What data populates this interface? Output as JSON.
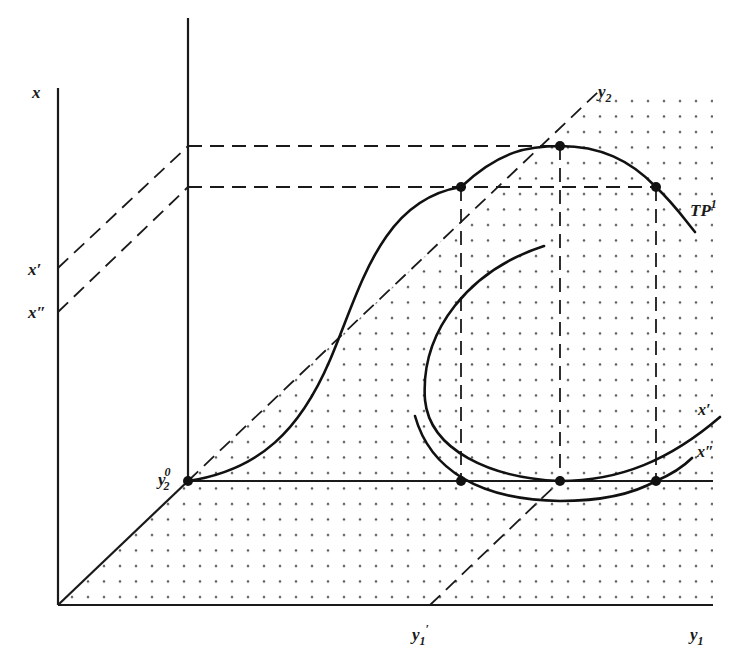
{
  "figure": {
    "type": "3d-production-possibility-diagram",
    "axes": {
      "vertical": "x",
      "horizontal": "y1",
      "depth": "y2"
    },
    "labels": {
      "x_axis": "x",
      "x_prime": "x′",
      "x_double_prime": "x″",
      "y2_axis": "y",
      "y2_axis_sub": "2",
      "y2_origin": "y",
      "y2_origin_sub": "2",
      "y2_origin_sup": "0",
      "tp_curve": "TP",
      "tp_curve_sup": "1",
      "isoquant_x_prime": "x′",
      "isoquant_x_double_prime": "x″",
      "y1_prime": "y",
      "y1_prime_sub": "1",
      "y1_prime_mark": "′",
      "y1_axis": "y",
      "y1_axis_sub": "1"
    },
    "colors": {
      "ink": "#1a1a1a",
      "dot_fill": "#555555",
      "background": "#ffffff"
    },
    "points": [
      {
        "name": "y2-origin-point",
        "x": 188,
        "y": 481
      },
      {
        "name": "tp-left-point",
        "x": 461,
        "y": 187
      },
      {
        "name": "tp-peak-point",
        "x": 560,
        "y": 146
      },
      {
        "name": "tp-right-point",
        "x": 656,
        "y": 187
      },
      {
        "name": "base-left-point",
        "x": 461,
        "y": 481
      },
      {
        "name": "base-mid-point",
        "x": 560,
        "y": 481
      },
      {
        "name": "base-right-point",
        "x": 656,
        "y": 481
      }
    ]
  }
}
